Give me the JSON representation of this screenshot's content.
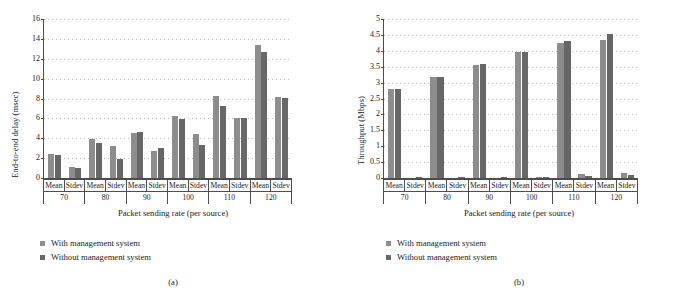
{
  "figure": {
    "panels": [
      {
        "caption": "(a)",
        "chart_data": {
          "type": "bar",
          "title": "",
          "xlabel": "Packet sending rate (per source)",
          "ylabel": "End-to-end delay (msec)",
          "ylim": [
            0,
            16
          ],
          "ytick_step": 2,
          "yticks": [
            "0",
            "2",
            "4",
            "6",
            "8",
            "10",
            "12",
            "14",
            "16"
          ],
          "grid": true,
          "legend_position": "below-left",
          "groups": [
            "70",
            "80",
            "90",
            "100",
            "110",
            "120"
          ],
          "subcategories": [
            "Mean",
            "Stdev"
          ],
          "categories": [
            "70 Mean",
            "70 Stdev",
            "80 Mean",
            "80 Stdev",
            "90 Mean",
            "90 Stdev",
            "100 Mean",
            "100 Stdev",
            "110 Mean",
            "110 Stdev",
            "120 Mean",
            "120 Stdev"
          ],
          "series": [
            {
              "name": "With management system",
              "color": "#8d8d8d",
              "values": [
                2.45,
                1.15,
                3.9,
                3.2,
                4.5,
                2.75,
                6.25,
                4.4,
                8.3,
                6.0,
                13.35,
                8.2
              ]
            },
            {
              "name": "Without management system",
              "color": "#676767",
              "values": [
                2.3,
                1.05,
                3.55,
                1.9,
                4.6,
                3.0,
                5.9,
                3.35,
                7.2,
                6.0,
                12.65,
                8.05
              ]
            }
          ]
        }
      },
      {
        "caption": "(b)",
        "chart_data": {
          "type": "bar",
          "title": "",
          "xlabel": "Packet sending rate (per source)",
          "ylabel": "Throughput (Mbps)",
          "ylim": [
            0,
            5
          ],
          "ytick_step": 0.5,
          "yticks": [
            "0",
            "0.5",
            "1",
            "1.5",
            "2",
            "2.5",
            "3",
            "3.5",
            "4",
            "4.5",
            "5"
          ],
          "grid": true,
          "legend_position": "below-left",
          "groups": [
            "70",
            "80",
            "90",
            "100",
            "110",
            "120"
          ],
          "subcategories": [
            "Mean",
            "Stdev"
          ],
          "categories": [
            "70 Mean",
            "70 Stdev",
            "80 Mean",
            "80 Stdev",
            "90 Mean",
            "90 Stdev",
            "100 Mean",
            "100 Stdev",
            "110 Mean",
            "110 Stdev",
            "120 Mean",
            "120 Stdev"
          ],
          "series": [
            {
              "name": "With management system",
              "color": "#8d8d8d",
              "values": [
                2.79,
                0.0,
                3.17,
                0.0,
                3.56,
                0.0,
                3.96,
                0.03,
                4.26,
                0.12,
                4.35,
                0.16
              ]
            },
            {
              "name": "Without management system",
              "color": "#676767",
              "values": [
                2.79,
                0.02,
                3.18,
                0.02,
                3.57,
                0.02,
                3.96,
                0.04,
                4.3,
                0.07,
                4.52,
                0.11
              ]
            }
          ]
        }
      }
    ],
    "legend": [
      {
        "label": "With management system",
        "color": "#8d8d8d"
      },
      {
        "label": "Without management system",
        "color": "#676767"
      }
    ]
  }
}
